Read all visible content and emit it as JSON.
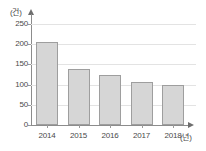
{
  "chart_data": {
    "type": "bar",
    "title": "",
    "subtitle": "",
    "categories": [
      "2014",
      "2015",
      "2016",
      "2017",
      "2018"
    ],
    "values": [
      205,
      139,
      123,
      106,
      99
    ],
    "xlabel": "(년)",
    "ylabel": "(건)",
    "ylim": [
      0,
      250
    ],
    "yticks": [
      0,
      50,
      100,
      150,
      200,
      250
    ],
    "ytick_labels": [
      "0",
      "50",
      "100",
      "150",
      "200",
      "250"
    ],
    "grid": true,
    "grid_axis": "y",
    "legend": false,
    "legend_position": "none",
    "series": [
      {
        "name": "",
        "values": [
          205,
          139,
          123,
          106,
          99
        ]
      }
    ],
    "annotations": []
  },
  "style": {
    "bar_fill": "#d6d6d6",
    "bar_border": "#9e9e9e",
    "axis_color": "#8c8c8c",
    "grid_color": "#e3e3e3",
    "text_color": "#4a4a4a",
    "background": "#ffffff"
  }
}
